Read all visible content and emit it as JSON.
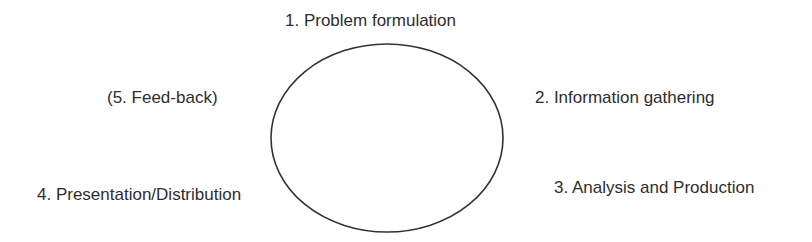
{
  "diagram": {
    "type": "cycle",
    "stages": [
      {
        "id": "s1",
        "label": "1. Problem formulation"
      },
      {
        "id": "s2",
        "label": "2. Information gathering"
      },
      {
        "id": "s3",
        "label": "3. Analysis and Production"
      },
      {
        "id": "s4",
        "label": "4. Presentation/Distribution"
      },
      {
        "id": "s5",
        "label": "(5. Feed-back)"
      }
    ],
    "colors": {
      "stroke": "#333333",
      "text": "#2e2e2e",
      "background": "#ffffff"
    }
  }
}
